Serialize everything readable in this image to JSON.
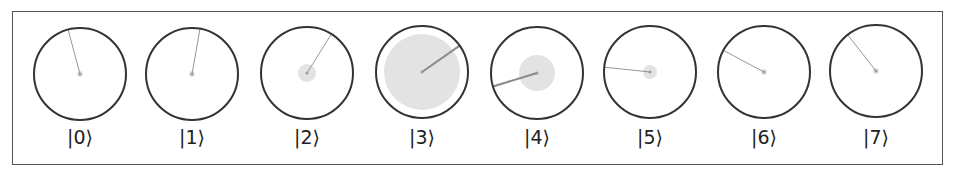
{
  "diagram": {
    "type": "quantum-circle-notation",
    "register_size": 8,
    "colors": {
      "frame": "#555555",
      "circle_outline": "#333333",
      "magnitude_fill": "#e3e3e3",
      "phase_line": "#8a8a8a",
      "label": "#222222"
    },
    "states": [
      {
        "label": "|0⟩",
        "cx": 80,
        "cy": 74,
        "magnitude_radius": 3,
        "phase_deg": 105
      },
      {
        "label": "|1⟩",
        "cx": 192,
        "cy": 74,
        "magnitude_radius": 3,
        "phase_deg": 80
      },
      {
        "label": "|2⟩",
        "cx": 307,
        "cy": 73,
        "magnitude_radius": 9,
        "phase_deg": 58
      },
      {
        "label": "|3⟩",
        "cx": 422,
        "cy": 72,
        "magnitude_radius": 38,
        "phase_deg": 35
      },
      {
        "label": "|4⟩",
        "cx": 537,
        "cy": 73,
        "magnitude_radius": 18,
        "phase_deg": 197
      },
      {
        "label": "|5⟩",
        "cx": 650,
        "cy": 72,
        "magnitude_radius": 7,
        "phase_deg": 174
      },
      {
        "label": "|6⟩",
        "cx": 764,
        "cy": 72,
        "magnitude_radius": 3,
        "phase_deg": 152
      },
      {
        "label": "|7⟩",
        "cx": 876,
        "cy": 71,
        "magnitude_radius": 3,
        "phase_deg": 128
      }
    ],
    "outer_radius": 46
  }
}
